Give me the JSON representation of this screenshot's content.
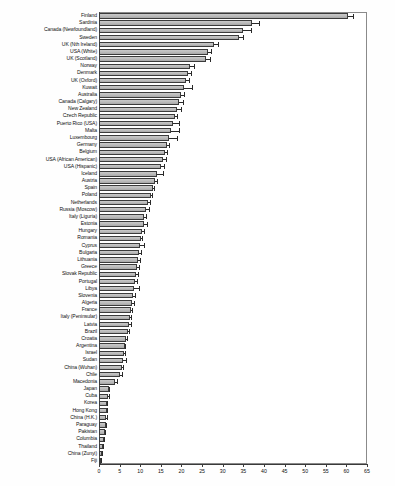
{
  "chart_data": {
    "type": "bar",
    "orientation": "horizontal",
    "title": "",
    "xlabel": "",
    "ylabel": "",
    "xlim": [
      0,
      65
    ],
    "xticks": [
      0,
      5,
      10,
      15,
      20,
      25,
      30,
      35,
      40,
      45,
      50,
      55,
      60,
      65
    ],
    "grid": false,
    "legend": null,
    "categories": [
      "Finland",
      "Sardinia",
      "Canada (Newfoundland)",
      "Sweden",
      "UK (Nth Ireland)",
      "USA (White)",
      "UK (Scotland)",
      "Norway",
      "Denmark",
      "UK (Oxford)",
      "Kuwait",
      "Australia",
      "Canada (Calgary)",
      "New Zealand",
      "Czech Republic",
      "Puerto Rico (USA)",
      "Malta",
      "Luxembourg",
      "Germany",
      "Belgium",
      "USA (African American)",
      "USA (Hispanic)",
      "Iceland",
      "Austria",
      "Spain",
      "Poland",
      "Netherlands",
      "Russia (Moscow)",
      "Italy (Liguria)",
      "Estonia",
      "Hungary",
      "Romania",
      "Cyprus",
      "Bulgaria",
      "Lithuania",
      "Greece",
      "Slovak Republic",
      "Portugal",
      "Libya",
      "Slovenia",
      "Algeria",
      "France",
      "Italy (Peninsular)",
      "Latvia",
      "Brazil",
      "Croatia",
      "Argentina",
      "Israel",
      "Sudan",
      "China (Wuhan)",
      "Chile",
      "Macedonia",
      "Japan",
      "Cuba",
      "Korea",
      "Hong Kong",
      "China (H.K.)",
      "Paraguay",
      "Pakistan",
      "Columbia",
      "Thailand",
      "China (Zunyi)",
      "Fiji"
    ],
    "values": [
      60.5,
      37.0,
      35.0,
      34.0,
      28.0,
      26.5,
      26.0,
      22.0,
      21.5,
      21.0,
      20.5,
      20.0,
      19.5,
      19.0,
      18.5,
      18.0,
      17.5,
      17.0,
      16.5,
      16.0,
      15.5,
      15.0,
      14.0,
      13.5,
      13.0,
      12.5,
      12.0,
      11.5,
      11.0,
      10.8,
      10.5,
      10.2,
      10.0,
      9.8,
      9.5,
      9.2,
      9.0,
      8.8,
      8.5,
      8.2,
      8.0,
      7.8,
      7.5,
      7.2,
      7.0,
      6.5,
      6.2,
      6.0,
      5.8,
      5.5,
      5.2,
      4.0,
      2.4,
      2.2,
      2.0,
      1.9,
      1.8,
      1.6,
      1.4,
      1.2,
      1.0,
      0.8,
      0.5
    ],
    "errors": [
      1.4,
      2.0,
      2.0,
      1.2,
      1.0,
      0.8,
      1.1,
      1.2,
      0.9,
      1.0,
      2.2,
      0.7,
      1.0,
      1.2,
      0.7,
      1.6,
      2.2,
      2.0,
      0.6,
      0.7,
      1.0,
      0.9,
      1.8,
      0.7,
      0.5,
      0.5,
      0.6,
      0.8,
      0.7,
      1.1,
      0.5,
      0.5,
      1.2,
      0.6,
      0.6,
      0.6,
      0.6,
      0.6,
      1.4,
      0.8,
      0.7,
      0.4,
      0.4,
      0.8,
      0.4,
      0.6,
      0.4,
      0.5,
      1.0,
      0.5,
      0.5,
      0.6,
      0.2,
      0.5,
      0.2,
      0.3,
      0.3,
      0.4,
      0.3,
      0.3,
      0.2,
      0.2,
      0.3
    ]
  }
}
